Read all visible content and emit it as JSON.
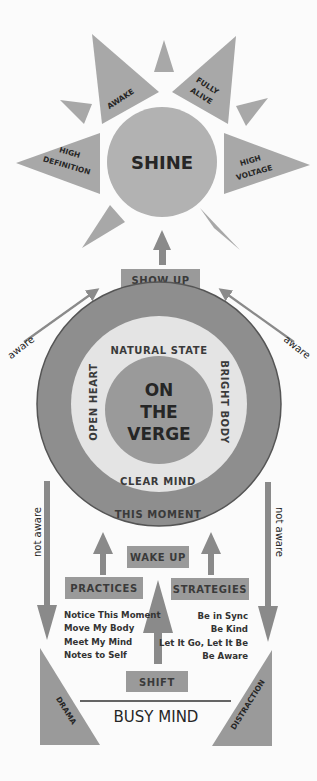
{
  "colors": {
    "background": "#fbfbfb",
    "shape_gray": "#a8a8a8",
    "ring_outer": "#8e8e8e",
    "ring_outer_border": "#555555",
    "ring_middle": "#e4e4e4",
    "ring_inner": "#9a9a9a",
    "box_gray": "#9a9a9a",
    "arrow_gray": "#8a8a8a",
    "text": "#262626"
  },
  "sun": {
    "center_label": "SHINE",
    "rays": [
      {
        "id": "awake",
        "lines": [
          "AWAKE"
        ]
      },
      {
        "id": "fully-alive",
        "lines": [
          "FULLY",
          "ALIVE"
        ]
      },
      {
        "id": "high-definition",
        "lines": [
          "HIGH",
          "DEFINITION"
        ]
      },
      {
        "id": "high-voltage",
        "lines": [
          "HIGH",
          "VOLTAGE"
        ]
      }
    ]
  },
  "show_up": {
    "label": "SHOW UP"
  },
  "side_arrows": {
    "left_upper": "aware",
    "right_upper": "aware",
    "left_lower": "not aware",
    "right_lower": "not aware"
  },
  "verge": {
    "center_lines": [
      "ON",
      "THE",
      "VERGE"
    ],
    "top": "NATURAL STATE",
    "left": "OPEN HEART",
    "right": "BRIGHT BODY",
    "bottom_inner": "CLEAR MIND",
    "bottom_outer": "THIS MOMENT"
  },
  "wake_up": {
    "label": "WAKE UP"
  },
  "practices": {
    "label": "PRACTICES",
    "items": [
      "Notice This Moment",
      "Move My Body",
      "Meet My Mind",
      "Notes to Self"
    ]
  },
  "strategies": {
    "label": "STRATEGIES",
    "items": [
      "Be in Sync",
      "Be Kind",
      "Let It Go, Let It Be",
      "Be Aware"
    ]
  },
  "shift": {
    "label": "SHIFT"
  },
  "busy_mind": {
    "label": "BUSY MIND",
    "left": "DRAMA",
    "right": "DISTRACTION"
  }
}
